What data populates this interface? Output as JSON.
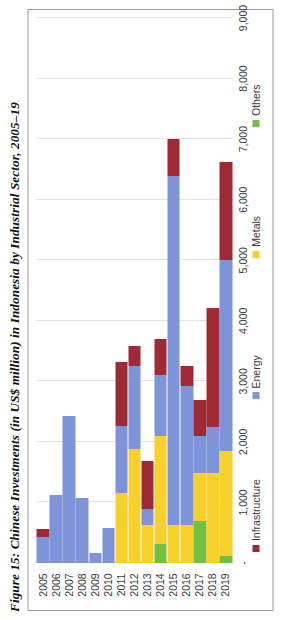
{
  "caption": "Figure 15: Chinese Investments (in US$ million) in Indonesia by Industrial Sector, 2005–19",
  "legend": {
    "position": "bottom",
    "items": [
      {
        "label": "Infrastructure",
        "color": "#9e2a36",
        "icon": "square-swatch-icon"
      },
      {
        "label": "Energy",
        "color": "#7d95d8",
        "icon": "square-swatch-icon"
      },
      {
        "label": "Metals",
        "color": "#f7d game",
        "color_fix": "#f7d02c",
        "icon": "square-swatch-icon"
      },
      {
        "label": "Others",
        "color": "#72bf44",
        "icon": "square-swatch-icon"
      }
    ]
  },
  "axis": {
    "tick_labels": [
      "-",
      "1,000",
      "2,000",
      "3,000",
      "4,000",
      "5,000",
      "6,000",
      "7,000",
      "8,000",
      "9,000"
    ],
    "tick_values": [
      0,
      1000,
      2000,
      3000,
      4000,
      5000,
      6000,
      7000,
      8000,
      9000
    ]
  },
  "chart_data": {
    "type": "bar",
    "orientation": "horizontal",
    "stacked": true,
    "title": "Figure 15: Chinese Investments (in US$ million) in Indonesia by Industrial Sector, 2005–19",
    "xlabel": "",
    "ylabel": "",
    "xlim": [
      0,
      9000
    ],
    "grid": true,
    "legend_position": "bottom",
    "categories": [
      "2005",
      "2006",
      "2007",
      "2008",
      "2009",
      "2010",
      "2011",
      "2012",
      "2013",
      "2014",
      "2015",
      "2016",
      "2017",
      "2018",
      "2019"
    ],
    "series": [
      {
        "name": "Infrastructure",
        "color": "#9e2a36",
        "values": [
          130,
          0,
          0,
          0,
          0,
          0,
          1050,
          330,
          790,
          600,
          610,
          340,
          590,
          1970,
          1620
        ]
      },
      {
        "name": "Energy",
        "color": "#7d95d8",
        "values": [
          430,
          1120,
          2420,
          1070,
          160,
          570,
          1120,
          1370,
          270,
          1010,
          5770,
          2300,
          620,
          750,
          3150
        ]
      },
      {
        "name": "Metals",
        "color": "#f7d02c",
        "values": [
          0,
          0,
          0,
          0,
          0,
          0,
          1150,
          1880,
          620,
          1770,
          620,
          620,
          780,
          1490,
          1730
        ]
      },
      {
        "name": "Others",
        "color": "#72bf44",
        "values": [
          0,
          0,
          0,
          0,
          0,
          0,
          0,
          0,
          0,
          320,
          0,
          0,
          700,
          0,
          120
        ]
      }
    ],
    "totals": [
      560,
      1120,
      2420,
      1070,
      160,
      570,
      3320,
      3580,
      1680,
      3700,
      7000,
      3260,
      2690,
      4210,
      6620
    ],
    "stack_order": [
      "Others",
      "Metals",
      "Energy",
      "Infrastructure"
    ],
    "units": "US$ million"
  }
}
